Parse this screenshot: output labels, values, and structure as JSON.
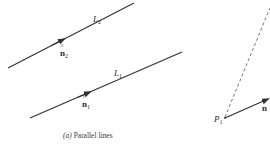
{
  "figure": {
    "caption_prefix": "(a)",
    "caption_text": " Parallel lines",
    "colors": {
      "line": "#333333",
      "dashed": "#666666",
      "text": "#2b2b2b"
    }
  },
  "lines": [
    {
      "id": "L2",
      "label": "L",
      "label_sub": "2",
      "start": [
        8,
        68
      ],
      "end": [
        134,
        3
      ],
      "normal_label": "n",
      "normal_sub": "2"
    },
    {
      "id": "L1",
      "label": "L",
      "label_sub": "1",
      "start": [
        30,
        118
      ],
      "end": [
        182,
        52
      ],
      "normal_label": "n",
      "normal_sub": "1"
    }
  ],
  "point": {
    "label": "P",
    "label_sub": "1",
    "position": [
      225,
      118
    ]
  },
  "unit_normal": {
    "label": "n",
    "hat": "^"
  }
}
